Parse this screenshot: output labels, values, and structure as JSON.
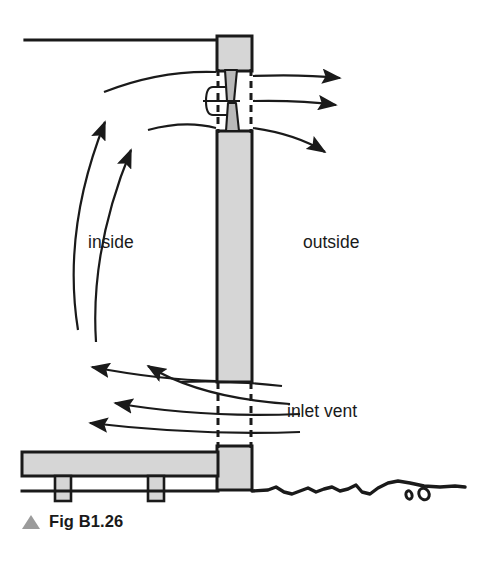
{
  "figure": {
    "caption": "Fig B1.26",
    "caption_marker_icon": "triangle-up-icon",
    "caption_marker_color": "#9b9b9b"
  },
  "diagram": {
    "type": "cross-section",
    "labels": {
      "inside": "inside",
      "outside": "outside",
      "inlet_vent": "inlet vent"
    },
    "colors": {
      "masonry_fill": "#d6d6d6",
      "outline": "#1a1a1a",
      "background": "#ffffff",
      "caption_marker": "#9b9b9b"
    },
    "components": [
      {
        "name": "ceiling-line",
        "kind": "line"
      },
      {
        "name": "wall",
        "kind": "masonry",
        "fill": "#d6d6d6"
      },
      {
        "name": "wall-head-block",
        "kind": "masonry",
        "fill": "#d6d6d6"
      },
      {
        "name": "wall-base-block",
        "kind": "masonry",
        "fill": "#d6d6d6"
      },
      {
        "name": "outlet-vent",
        "kind": "vent-assembly"
      },
      {
        "name": "inlet-vent",
        "kind": "vent-gap"
      },
      {
        "name": "floor-slab",
        "kind": "masonry",
        "fill": "#d6d6d6"
      },
      {
        "name": "floor-joist-left",
        "kind": "masonry",
        "fill": "#d6d6d6"
      },
      {
        "name": "floor-joist-right",
        "kind": "masonry",
        "fill": "#d6d6d6"
      },
      {
        "name": "ground-line",
        "kind": "terrain"
      },
      {
        "name": "pebble-small",
        "kind": "terrain-detail"
      },
      {
        "name": "pebble-large",
        "kind": "terrain-detail"
      }
    ],
    "airflow": {
      "inlet_arrow_count": 4,
      "inlet_direction": "leftward into interior",
      "circulation_arrow_count": 2,
      "circulation_direction": "upward along interior wall",
      "outlet_arrow_count": 3,
      "outlet_direction": "rightward out of building"
    }
  }
}
